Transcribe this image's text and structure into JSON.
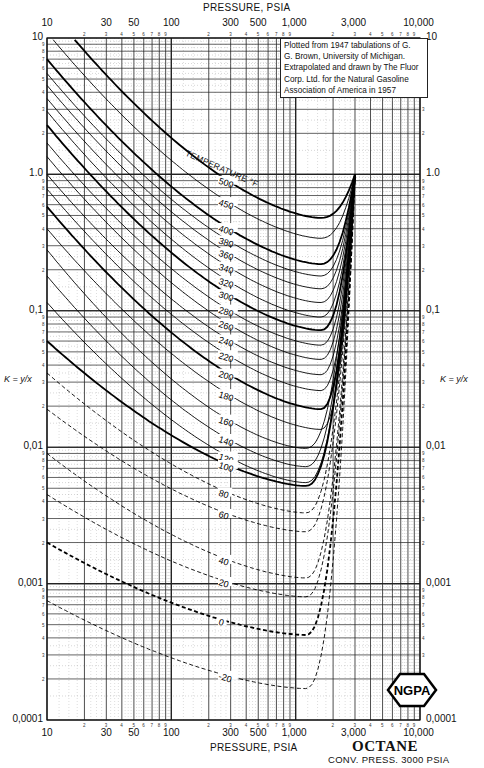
{
  "chart_data": {
    "type": "line",
    "title": "OCTANE",
    "subtitle": "CONV. PRESS. 3000 PSIA",
    "xlabel": "PRESSURE, PSIA",
    "ylabel": "K = y/x",
    "xscale": "log",
    "yscale": "log",
    "xlim": [
      10,
      10000
    ],
    "ylim": [
      0.0001,
      10
    ],
    "x_ticks": [
      "10",
      "30",
      "50",
      "100",
      "300",
      "500",
      "1,000",
      "3,000",
      "10,000"
    ],
    "y_ticks": [
      "10",
      "1.0",
      "0.1",
      "0.01",
      "0.001",
      "0.0001"
    ],
    "grid": true,
    "legend_title": "TEMPERATURE °F",
    "convergence_point": {
      "pressure": 3000,
      "K": 1.0
    },
    "series": [
      {
        "name": "500",
        "K_at_10psia": 17,
        "K_min": 0.48,
        "style": "bold"
      },
      {
        "name": "450",
        "K_at_10psia": 11,
        "K_min": 0.34,
        "style": "solid"
      },
      {
        "name": "400",
        "K_at_10psia": 7.0,
        "K_min": 0.22,
        "style": "bold"
      },
      {
        "name": "380",
        "K_at_10psia": 5.5,
        "K_min": 0.18,
        "style": "solid"
      },
      {
        "name": "360",
        "K_at_10psia": 4.5,
        "K_min": 0.145,
        "style": "solid"
      },
      {
        "name": "340",
        "K_at_10psia": 3.6,
        "K_min": 0.115,
        "style": "solid"
      },
      {
        "name": "320",
        "K_at_10psia": 2.9,
        "K_min": 0.09,
        "style": "solid"
      },
      {
        "name": "300",
        "K_at_10psia": 2.3,
        "K_min": 0.072,
        "style": "bold"
      },
      {
        "name": "280",
        "K_at_10psia": 1.7,
        "K_min": 0.056,
        "style": "solid"
      },
      {
        "name": "260",
        "K_at_10psia": 1.35,
        "K_min": 0.044,
        "style": "solid"
      },
      {
        "name": "240",
        "K_at_10psia": 1.0,
        "K_min": 0.034,
        "style": "solid"
      },
      {
        "name": "220",
        "K_at_10psia": 0.78,
        "K_min": 0.026,
        "style": "solid"
      },
      {
        "name": "200",
        "K_at_10psia": 0.58,
        "K_min": 0.019,
        "style": "bold"
      },
      {
        "name": "180",
        "K_at_10psia": 0.4,
        "K_min": 0.0135,
        "style": "solid"
      },
      {
        "name": "160",
        "K_at_10psia": 0.28,
        "K_min": 0.0098,
        "style": "solid"
      },
      {
        "name": "140",
        "K_at_10psia": 0.18,
        "K_min": 0.0072,
        "style": "solid"
      },
      {
        "name": "120",
        "K_at_10psia": 0.115,
        "K_min": 0.0055,
        "style": "solid"
      },
      {
        "name": "100",
        "K_at_10psia": 0.06,
        "K_min": 0.0052,
        "style": "bold"
      },
      {
        "name": "80",
        "K_at_10psia": 0.035,
        "K_min": 0.0033,
        "style": "dashed"
      },
      {
        "name": "60",
        "K_at_10psia": 0.019,
        "K_min": 0.0024,
        "style": "dashed"
      },
      {
        "name": "40",
        "K_at_10psia": 0.009,
        "K_min": 0.0011,
        "style": "dashed"
      },
      {
        "name": "20",
        "K_at_10psia": 0.0045,
        "K_min": 0.0008,
        "style": "dashed"
      },
      {
        "name": "0",
        "K_at_10psia": 0.002,
        "K_min": 0.00042,
        "style": "dashed-bold"
      },
      {
        "name": "-20",
        "K_at_10psia": 0.00075,
        "K_min": 0.00017,
        "style": "dashed"
      }
    ],
    "annotation": "Plotted from 1947 tabulations of G. G. Brown, University of Michigan. Extrapolated and drawn by The Fluor Corp. Ltd. for the Natural Gasoline Association of America in 1957",
    "logo": "NGPA"
  },
  "labels": {
    "top_axis_title": "PRESSURE, PSIA",
    "bottom_axis_title": "PRESSURE, PSIA",
    "left_axis_title": "K = y/x",
    "right_axis_title": "K = y/x",
    "temperature_title": "TEMPERATURE °F",
    "note_lines": [
      "Plotted from 1947 tabulations of G.",
      "G. Brown, University of Michigan.",
      "Extrapolated and drawn by The Fluor",
      "Corp. Ltd. for the Natural Gasoline",
      "Association of America in 1957"
    ],
    "title": "OCTANE",
    "subtitle": "CONV. PRESS. 3000  PSIA",
    "logo_text": "NGPA"
  }
}
